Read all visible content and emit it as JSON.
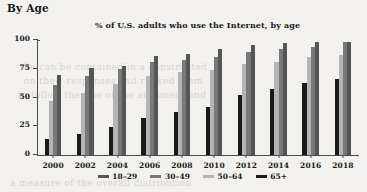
{
  "section": {
    "heading": "By Age"
  },
  "bleed_text": {
    "line1": "the can be contained in a constructed",
    "line2": "on their responses and ranked them",
    "line3": "to follow the line of the argument and",
    "line4": "a measure of the overall distribution"
  },
  "chart_data": {
    "type": "bar",
    "title": "% of U.S. adults who use the Internet, by age",
    "xlabel": "",
    "ylabel": "",
    "ylim": [
      0,
      100
    ],
    "yticks": [
      0,
      25,
      50,
      75,
      100
    ],
    "ytick_labels": [
      "0",
      "25",
      "50",
      "75",
      "100"
    ],
    "grid": false,
    "legend_position": "bottom",
    "categories": [
      "2000",
      "2002",
      "2004",
      "2006",
      "2008",
      "2010",
      "2012",
      "2014",
      "2016",
      "2018"
    ],
    "bar_order": [
      "65+",
      "50–64",
      "30–49",
      "18–29"
    ],
    "series": [
      {
        "name": "65+",
        "color": "#1a1a1a",
        "values": [
          14,
          18,
          24,
          32,
          37,
          42,
          52,
          57,
          63,
          66
        ]
      },
      {
        "name": "50–64",
        "color": "#b4b4b4",
        "values": [
          47,
          54,
          62,
          69,
          72,
          74,
          79,
          81,
          85,
          87
        ]
      },
      {
        "name": "30–49",
        "color": "#787878",
        "values": [
          61,
          69,
          75,
          81,
          83,
          85,
          90,
          92,
          94,
          98
        ]
      },
      {
        "name": "18–29",
        "color": "#555555",
        "values": [
          70,
          76,
          77,
          86,
          88,
          92,
          96,
          97,
          98,
          98
        ]
      }
    ]
  },
  "legend": {
    "items": [
      {
        "label": "18–29",
        "color": "#555555"
      },
      {
        "label": "30–49",
        "color": "#787878"
      },
      {
        "label": "50–64",
        "color": "#b4b4b4"
      },
      {
        "label": "65+",
        "color": "#1a1a1a"
      }
    ]
  }
}
